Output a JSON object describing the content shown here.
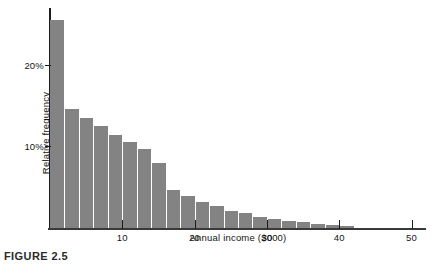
{
  "figure": {
    "caption": "FIGURE 2.5",
    "background_color": "#ffffff",
    "bar_color": "#838383",
    "axis_color": "#1c1c1c",
    "bar_separator_color": "#ffffff"
  },
  "chart_data": {
    "type": "bar",
    "title": "",
    "subtitle": "",
    "xlabel": "Annual income ($000)",
    "ylabel": "Relative frequency",
    "xlim": [
      0,
      52
    ],
    "ylim": [
      0,
      26.5
    ],
    "grid": false,
    "legend": null,
    "bin_width": 2,
    "x_tick_values": [
      10,
      20,
      30,
      40,
      50
    ],
    "x_tick_labels": [
      "10",
      "20",
      "30",
      "40",
      "50"
    ],
    "y_tick_values": [
      10,
      20
    ],
    "y_tick_labels": [
      "10%",
      "20%"
    ],
    "value_unit": "percent",
    "categories": [
      "0-2",
      "2-4",
      "4-6",
      "6-8",
      "8-10",
      "10-12",
      "12-14",
      "14-16",
      "16-18",
      "18-20",
      "20-22",
      "22-24",
      "24-26",
      "26-28",
      "28-30",
      "30-32",
      "32-34",
      "34-36",
      "36-38",
      "38-40",
      "40-42"
    ],
    "bin_starts": [
      0,
      2,
      4,
      6,
      8,
      10,
      12,
      14,
      16,
      18,
      20,
      22,
      24,
      26,
      28,
      30,
      32,
      34,
      36,
      38,
      40
    ],
    "values": [
      25.5,
      14.6,
      13.5,
      12.5,
      11.4,
      10.6,
      9.7,
      8.0,
      4.7,
      3.9,
      3.2,
      2.7,
      2.1,
      1.8,
      1.4,
      1.1,
      0.9,
      0.7,
      0.5,
      0.4,
      0.3
    ]
  }
}
